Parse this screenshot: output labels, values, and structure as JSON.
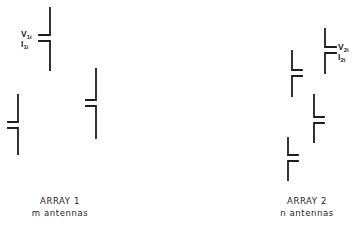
{
  "diagram": {
    "arrays": [
      {
        "id": "array-1",
        "caption_line1": "ARRAY 1",
        "caption_line2": "m antennas",
        "antenna_count_symbol": "m",
        "stub_direction": "left",
        "labeled_antenna": {
          "voltage_label": "V",
          "voltage_subscript": "1i",
          "current_label": "I",
          "current_subscript": "1i"
        },
        "antennas_drawn": 3
      },
      {
        "id": "array-2",
        "caption_line1": "ARRAY 2",
        "caption_line2": "n antennas",
        "antenna_count_symbol": "n",
        "stub_direction": "right",
        "labeled_antenna": {
          "voltage_label": "V",
          "voltage_subscript": "2i",
          "current_label": "I",
          "current_subscript": "2i"
        },
        "antennas_drawn": 4
      }
    ],
    "line_color": "#1e1e1e",
    "background": "#ffffff"
  }
}
